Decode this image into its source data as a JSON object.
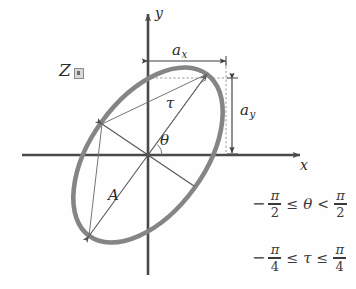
{
  "figure": {
    "axes": {
      "x_label": "x",
      "y_label": "y"
    },
    "labels": {
      "z_label": "Z",
      "z_subscript_icon": "small-box-glyph",
      "semi_axis_x": "a",
      "semi_axis_x_sub": "x",
      "semi_axis_y": "a",
      "semi_axis_y_sub": "y",
      "amplitude": "A",
      "ellipticity": "τ",
      "orientation": "θ"
    },
    "constraints": [
      {
        "name": "theta-range",
        "minus": "−",
        "left_num": "π",
        "left_den": "2",
        "rel1": "≤",
        "variable": "θ",
        "rel2": "<",
        "right_num": "π",
        "right_den": "2",
        "text": "−π/2 ≤ θ < π/2"
      },
      {
        "name": "tau-range",
        "minus": "−",
        "left_num": "π",
        "left_den": "4",
        "rel1": "≤",
        "variable": "τ",
        "rel2": "≤",
        "right_num": "π",
        "right_den": "4",
        "text": "−π/4 ≤ τ ≤ π/4"
      }
    ],
    "colors": {
      "ellipse_stroke": "#858585",
      "axis_stroke": "#4a4a4a",
      "thin_line_stroke": "#6e6e6e",
      "dashed_stroke": "#9a9a9a",
      "text": "#2b2b2b",
      "background": "#fefefe"
    },
    "geometry": {
      "origin_x": 148,
      "origin_y": 155,
      "ellipse_semi_major": 100,
      "ellipse_semi_minor": 57,
      "ellipse_rotation_deg": -54,
      "ellipse_stroke_width": 4.5,
      "bounding_half_width_ax": 78,
      "bounding_half_height_ay": 82
    }
  }
}
